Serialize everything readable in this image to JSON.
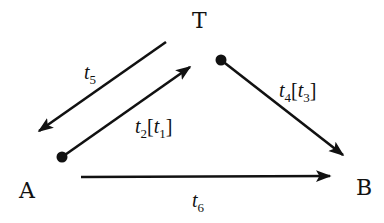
{
  "diagram": {
    "nodes": [
      {
        "id": "T",
        "label": "T"
      },
      {
        "id": "A",
        "label": "A"
      },
      {
        "id": "B",
        "label": "B"
      }
    ],
    "edges": [
      {
        "id": "t5",
        "from": "T",
        "to": "A",
        "label": {
          "base": "t",
          "sub": "5"
        }
      },
      {
        "id": "t2",
        "from": "A",
        "to": "T",
        "label": {
          "base": "t",
          "sub": "2",
          "bracket_base": "t",
          "bracket_sub": "1"
        },
        "start_marker": "dot"
      },
      {
        "id": "t4",
        "from": "T",
        "to": "B",
        "label": {
          "base": "t",
          "sub": "4",
          "bracket_base": "t",
          "bracket_sub": "3"
        },
        "start_marker": "dot"
      },
      {
        "id": "t6",
        "from": "A",
        "to": "B",
        "label": {
          "base": "t",
          "sub": "6"
        }
      }
    ],
    "brackets": {
      "open": "[",
      "close": "]"
    }
  }
}
